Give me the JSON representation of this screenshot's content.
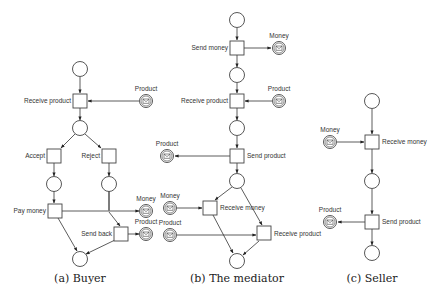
{
  "figures": [
    {
      "id": "buyer",
      "caption": "(a) Buyer",
      "transitions": {
        "receive_product": "Receive product",
        "accept": "Accept",
        "reject": "Reject",
        "pay_money": "Pay money",
        "send_back": "Send back"
      },
      "messages": {
        "product_in": "Product",
        "money_out": "Money",
        "product_out": "Product"
      }
    },
    {
      "id": "mediator",
      "caption": "(b) The mediator",
      "transitions": {
        "send_money": "Send money",
        "receive_product": "Receive product",
        "send_product": "Send product",
        "receive_money": "Receive money",
        "receive_product_2": "Receive product"
      },
      "messages": {
        "money_out": "Money",
        "product_in": "Product",
        "product_out": "Product",
        "money_in": "Money",
        "product_in_2": "Product"
      }
    },
    {
      "id": "seller",
      "caption": "(c) Seller",
      "transitions": {
        "receive_money": "Receive money",
        "send_product": "Send product"
      },
      "messages": {
        "money_in": "Money",
        "product_out": "Product"
      }
    }
  ],
  "icons": {
    "message": "envelope-icon"
  },
  "colors": {
    "stroke": "#444444",
    "fill": "#ffffff",
    "text": "#333333"
  }
}
